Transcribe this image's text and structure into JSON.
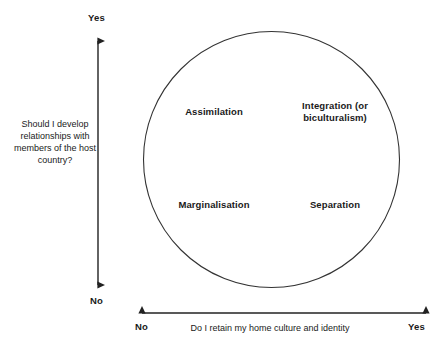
{
  "diagram": {
    "type": "two-by-two-matrix",
    "y_axis": {
      "caption": "Should I develop relationships with members of the host country?",
      "top_label": "Yes",
      "bottom_label": "No"
    },
    "x_axis": {
      "caption": "Do I retain my home culture and identity",
      "left_label": "No",
      "right_label": "Yes"
    },
    "quadrants": [
      {
        "key": "assimilation",
        "label": "Assimilation"
      },
      {
        "key": "integration",
        "label": "Integration (or biculturalism)"
      },
      {
        "key": "marginalisation",
        "label": "Marginalisation"
      },
      {
        "key": "separation",
        "label": "Separation"
      }
    ],
    "colors": {
      "background": "#ffffff",
      "stroke": "#333333",
      "text": "#1a1a1a"
    }
  }
}
